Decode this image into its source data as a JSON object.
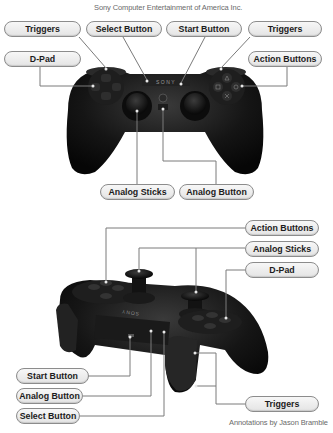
{
  "header": {
    "copyright": "Sony Computer Entertainment of America Inc."
  },
  "footer": {
    "credit": "Annotations by Jason Bramble"
  },
  "top_view": {
    "labels": {
      "triggers_left": "Triggers",
      "select": "Select Button",
      "start": "Start Button",
      "triggers_right": "Triggers",
      "dpad": "D-Pad",
      "action_buttons": "Action Buttons",
      "analog_sticks": "Analog Sticks",
      "analog_button": "Analog Button"
    },
    "logo_text": "SONY"
  },
  "side_view": {
    "labels": {
      "action_buttons": "Action Buttons",
      "analog_sticks": "Analog Sticks",
      "dpad": "D-Pad",
      "start": "Start Button",
      "analog_button": "Analog Button",
      "select": "Select Button",
      "triggers": "Triggers"
    },
    "logo_text": "SONY"
  },
  "colors": {
    "controller_body": "#141414",
    "label_fill": "#ececec",
    "label_border": "#8c8c8c",
    "leader_line": "#7a7a7a"
  }
}
